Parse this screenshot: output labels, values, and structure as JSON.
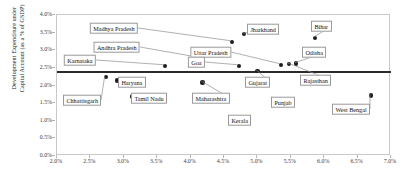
{
  "chart_data": {
    "type": "scatter",
    "title": "",
    "xlabel": "",
    "ylabel": "Development Expenditure under\nCapital Account (as a % of GSDP)",
    "xlim": [
      2.0,
      7.0
    ],
    "ylim": [
      0.0,
      4.0
    ],
    "x_ticks": [
      "2.0%",
      "2.5%",
      "3.0%",
      "3.5%",
      "4.0%",
      "4.5%",
      "5.0%",
      "5.5%",
      "6.0%",
      "6.5%",
      "7.0%"
    ],
    "x_tick_values": [
      2.0,
      2.5,
      3.0,
      3.5,
      4.0,
      4.5,
      5.0,
      5.5,
      6.0,
      6.5,
      7.0
    ],
    "y_ticks": [
      "0.0%",
      "0.5%",
      "1.0%",
      "1.5%",
      "2.0%",
      "2.5%",
      "3.0%",
      "3.5%",
      "4.0%"
    ],
    "y_tick_values": [
      0.0,
      0.5,
      1.0,
      1.5,
      2.0,
      2.5,
      3.0,
      3.5,
      4.0
    ],
    "grid": false,
    "legend": "none",
    "reference_line": {
      "orientation": "horizontal",
      "value": 2.42,
      "color": "#2b2b2b"
    },
    "point_color": "#1d1d1d",
    "points": [
      {
        "label": "Chhattisgarh",
        "x": 2.73,
        "y": 2.25
      },
      {
        "label": "Haryana",
        "x": 2.9,
        "y": 2.14
      },
      {
        "label": "Tamil Nadu",
        "x": 3.13,
        "y": 1.69
      },
      {
        "label": "Karnataka",
        "x": 3.62,
        "y": 2.56
      },
      {
        "label": "Andhra Pradesh",
        "x": 4.08,
        "y": 2.79
      },
      {
        "label": "Maharashtra",
        "x": 4.18,
        "y": 2.09
      },
      {
        "label": "Madhya Pradesh",
        "x": 4.62,
        "y": 3.24
      },
      {
        "label": "Kerala",
        "x": 4.66,
        "y": 1.1
      },
      {
        "label": "Goa",
        "x": 4.72,
        "y": 2.56
      },
      {
        "label": "Jharkhand",
        "x": 4.8,
        "y": 3.46
      },
      {
        "label": "Gujarat",
        "x": 5.0,
        "y": 2.41
      },
      {
        "label": "Punjab",
        "x": 5.3,
        "y": 1.6
      },
      {
        "label": "Uttar Pradesh",
        "x": 5.35,
        "y": 2.59
      },
      {
        "label": "Rajasthan",
        "x": 5.47,
        "y": 2.61
      },
      {
        "label": "Odisha",
        "x": 5.58,
        "y": 2.62
      },
      {
        "label": "Bihar",
        "x": 5.86,
        "y": 3.35
      },
      {
        "label": "West Bengal",
        "x": 6.7,
        "y": 1.72
      }
    ],
    "labels": [
      {
        "text": "Madhya Pradesh",
        "lx": 138,
        "ly": 28,
        "anchor": "right",
        "leader": true
      },
      {
        "text": "Jharkhand",
        "lx": 247,
        "ly": 29,
        "anchor": "left",
        "leader": true
      },
      {
        "text": "Bihar",
        "lx": 311,
        "ly": 26,
        "anchor": "left",
        "leader": true
      },
      {
        "text": "Andhra Pradesh",
        "lx": 140,
        "ly": 47,
        "anchor": "right",
        "leader": true
      },
      {
        "text": "Uttar Pradesh",
        "lx": 231,
        "ly": 52,
        "anchor": "right",
        "leader": true
      },
      {
        "text": "Odisha",
        "lx": 302,
        "ly": 52,
        "anchor": "left",
        "leader": true
      },
      {
        "text": "Karnataka",
        "lx": 96,
        "ly": 60,
        "anchor": "right",
        "leader": true
      },
      {
        "text": "Goa",
        "lx": 205,
        "ly": 62,
        "anchor": "right",
        "leader": true
      },
      {
        "text": "Gujarat",
        "lx": 245,
        "ly": 82,
        "anchor": "left",
        "leader": true
      },
      {
        "text": "Rajasthan",
        "lx": 300,
        "ly": 80,
        "anchor": "left",
        "leader": true
      },
      {
        "text": "Haryana",
        "lx": 118,
        "ly": 82,
        "anchor": "left",
        "leader": false
      },
      {
        "text": "Tamil Nadu",
        "lx": 131,
        "ly": 98,
        "anchor": "left",
        "leader": false
      },
      {
        "text": "Maharashtra",
        "lx": 192,
        "ly": 98,
        "anchor": "left",
        "leader": true
      },
      {
        "text": "Punjab",
        "lx": 271,
        "ly": 102,
        "anchor": "left",
        "leader": false
      },
      {
        "text": "Chhattisgarh",
        "lx": 63,
        "ly": 100,
        "anchor": "left",
        "leader": true
      },
      {
        "text": "Kerala",
        "lx": 228,
        "ly": 120,
        "anchor": "left",
        "leader": false
      },
      {
        "text": "West Bengal",
        "lx": 332,
        "ly": 109,
        "anchor": "left",
        "leader": true
      }
    ]
  }
}
